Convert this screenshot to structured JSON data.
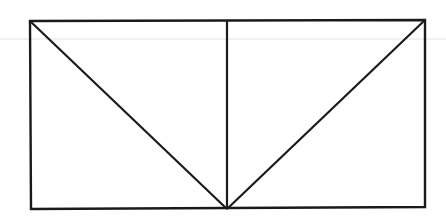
{
  "diagram": {
    "type": "geometric-figure",
    "stroke_color": "#1a1a1a",
    "background_color": "#ffffff",
    "faint_line_color": "#d8d8d8",
    "points": {
      "top_left": [
        30,
        21
      ],
      "top_right": [
        425,
        20
      ],
      "bottom_left": [
        31,
        209
      ],
      "bottom_right": [
        425,
        207
      ],
      "top_mid": [
        227,
        20
      ],
      "bottom_mid": [
        227,
        209
      ]
    },
    "labels": []
  }
}
